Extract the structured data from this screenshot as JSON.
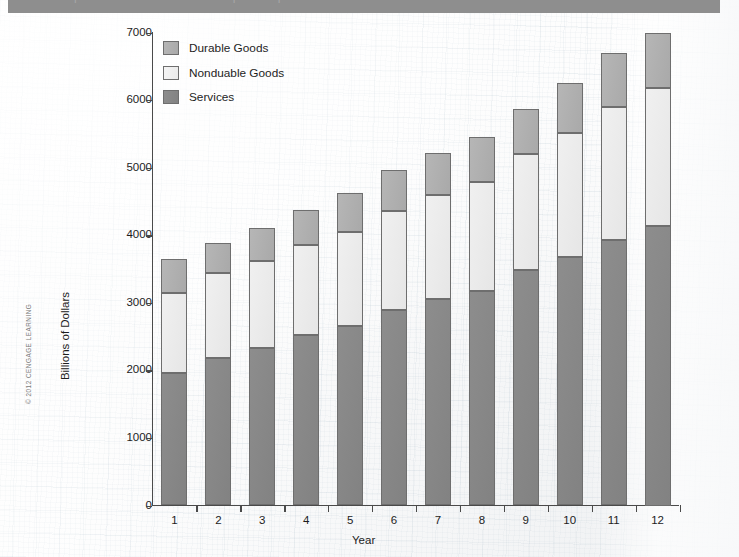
{
  "banner": {
    "ghost_text": "Composition of Personal Consumption Expenditures"
  },
  "copyright": {
    "text": "© 2012 CENGAGE LEARNING"
  },
  "legend": {
    "position": "top-left-inside",
    "items": [
      {
        "label": "Durable Goods",
        "color": "#afafaf",
        "key": "durable"
      },
      {
        "label": "Nonduable Goods",
        "color": "#ececec",
        "key": "nondurable"
      },
      {
        "label": "Services",
        "color": "#878787",
        "key": "services"
      }
    ]
  },
  "chart_data": {
    "type": "bar",
    "stacked": true,
    "title": "",
    "xlabel": "Year",
    "ylabel": "Billions of Dollars",
    "categories": [
      "1",
      "2",
      "3",
      "4",
      "5",
      "6",
      "7",
      "8",
      "9",
      "10",
      "11",
      "12"
    ],
    "ylim": [
      0,
      7000
    ],
    "yticks": [
      0,
      1000,
      2000,
      3000,
      4000,
      5000,
      6000,
      7000
    ],
    "grid": false,
    "series": [
      {
        "name": "Services",
        "key": "services",
        "color": "#878787",
        "values": [
          1960,
          2190,
          2330,
          2520,
          2660,
          2890,
          3060,
          3170,
          3480,
          3680,
          3930,
          4130
        ]
      },
      {
        "name": "Nonduable Goods",
        "key": "nondurable",
        "color": "#ececec",
        "values": [
          1190,
          1250,
          1290,
          1330,
          1390,
          1470,
          1530,
          1620,
          1720,
          1830,
          1970,
          2050
        ]
      },
      {
        "name": "Durable Goods",
        "key": "durable",
        "color": "#afafaf",
        "values": [
          500,
          450,
          480,
          530,
          580,
          610,
          630,
          660,
          670,
          750,
          800,
          820
        ]
      }
    ],
    "cumulative_tops": {
      "services": [
        1960,
        2190,
        2330,
        2520,
        2660,
        2890,
        3060,
        3170,
        3480,
        3680,
        3930,
        4130
      ],
      "nondurable": [
        3150,
        3440,
        3620,
        3850,
        4050,
        4360,
        4590,
        4790,
        5200,
        5510,
        5900,
        6180
      ],
      "totals": [
        3650,
        3890,
        4100,
        4380,
        4630,
        4970,
        5220,
        5450,
        5870,
        6260,
        6700,
        7000
      ]
    }
  }
}
